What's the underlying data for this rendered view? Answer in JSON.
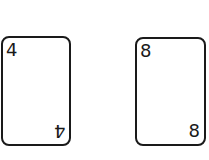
{
  "cards": [
    {
      "rank": "4",
      "position": "left"
    },
    {
      "rank": "8",
      "position": "right"
    }
  ]
}
